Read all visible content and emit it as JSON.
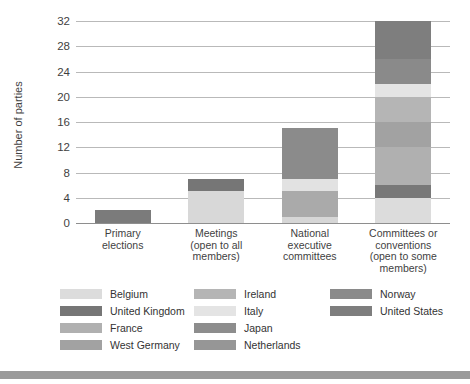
{
  "chart_data": {
    "type": "bar",
    "stacked": true,
    "title": "",
    "xlabel": "",
    "ylabel": "Number of parties",
    "ylim": [
      0,
      32
    ],
    "yticks": [
      0,
      4,
      8,
      12,
      16,
      20,
      24,
      28,
      32
    ],
    "grid": true,
    "legend_position": "bottom",
    "categories": [
      "Primary elections",
      "Meetings (open to all members)",
      "National executive committees",
      "Committees or conventions (open to some members)"
    ],
    "category_lines": [
      [
        "Primary",
        "elections"
      ],
      [
        "Meetings",
        "(open to all",
        "members)"
      ],
      [
        "National",
        "executive",
        "committees"
      ],
      [
        "Committees or",
        "conventions",
        "(open to some",
        "members)"
      ]
    ],
    "totals": [
      2,
      7,
      15,
      32
    ],
    "series": [
      {
        "name": "Belgium",
        "color": "#e2e2e2",
        "values": [
          0,
          0,
          1,
          4
        ]
      },
      {
        "name": "United Kingdom",
        "color": "#7b7b7b",
        "values": [
          2,
          2,
          0,
          2
        ]
      },
      {
        "name": "France",
        "color": "#a8a8a8",
        "values": [
          0,
          0,
          0,
          6
        ]
      },
      {
        "name": "West Germany",
        "color": "#9c9c9c",
        "values": [
          0,
          0,
          4,
          4
        ]
      },
      {
        "name": "Ireland",
        "color": "#bcbcbc",
        "values": [
          0,
          0,
          0,
          4
        ]
      },
      {
        "name": "Italy",
        "color": "#ececec",
        "values": [
          0,
          5,
          2,
          2
        ]
      },
      {
        "name": "Japan",
        "color": "#888888",
        "values": [
          0,
          0,
          0,
          0
        ]
      },
      {
        "name": "Netherlands",
        "color": "#919191",
        "values": [
          0,
          0,
          0,
          0
        ]
      },
      {
        "name": "Norway",
        "color": "#7f7f7f",
        "values": [
          0,
          0,
          4,
          4
        ]
      },
      {
        "name": "United States",
        "color": "#848484",
        "values": [
          0,
          0,
          4,
          6
        ]
      }
    ],
    "bars": [
      {
        "category": "Primary elections",
        "total": 2,
        "segments": [
          {
            "name": "United Kingdom",
            "value": 2,
            "color": "#7b7b7b"
          }
        ]
      },
      {
        "category": "Meetings (open to all members)",
        "total": 7,
        "segments": [
          {
            "name": "Italy",
            "value": 5,
            "color": "#d8d8d8"
          },
          {
            "name": "United Kingdom",
            "value": 2,
            "color": "#767676"
          }
        ]
      },
      {
        "category": "National executive committees",
        "total": 15,
        "segments": [
          {
            "name": "Belgium",
            "value": 1,
            "color": "#d6d6d6"
          },
          {
            "name": "West Germany",
            "value": 4,
            "color": "#aaaaaa"
          },
          {
            "name": "Italy",
            "value": 2,
            "color": "#e2e2e2"
          },
          {
            "name": "United States",
            "value": 8,
            "color": "#8b8b8b"
          }
        ]
      },
      {
        "category": "Committees or conventions (open to some members)",
        "total": 32,
        "segments": [
          {
            "name": "Belgium",
            "value": 4,
            "color": "#dcdcdc"
          },
          {
            "name": "United Kingdom",
            "value": 2,
            "color": "#787878"
          },
          {
            "name": "France",
            "value": 6,
            "color": "#b0b0b0"
          },
          {
            "name": "West Germany",
            "value": 4,
            "color": "#a2a2a2"
          },
          {
            "name": "Ireland",
            "value": 4,
            "color": "#b5b5b5"
          },
          {
            "name": "Italy",
            "value": 2,
            "color": "#e4e4e4"
          },
          {
            "name": "Norway",
            "value": 4,
            "color": "#8a8a8a"
          },
          {
            "name": "United States",
            "value": 6,
            "color": "#7e7e7e"
          }
        ]
      }
    ],
    "legend_columns": [
      [
        {
          "label": "Belgium",
          "color": "#dcdcdc"
        },
        {
          "label": "United Kingdom",
          "color": "#767676"
        },
        {
          "label": "France",
          "color": "#b0b0b0"
        },
        {
          "label": "West Germany",
          "color": "#a2a2a2"
        }
      ],
      [
        {
          "label": "Ireland",
          "color": "#b5b5b5"
        },
        {
          "label": "Italy",
          "color": "#e4e4e4"
        },
        {
          "label": "Japan",
          "color": "#8d8d8d"
        },
        {
          "label": "Netherlands",
          "color": "#969696"
        }
      ],
      [
        {
          "label": "Norway",
          "color": "#8a8a8a"
        },
        {
          "label": "United States",
          "color": "#7e7e7e"
        }
      ]
    ]
  }
}
